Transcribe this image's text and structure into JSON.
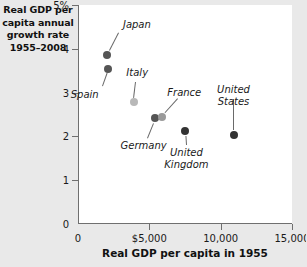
{
  "chart_data": {
    "type": "scatter",
    "title_lines": [
      "Real GDP per",
      "capita annual",
      "growth rate",
      "1955–2008"
    ],
    "xlabel": "Real GDP per capita in 1955",
    "ylabel": "Real GDP per capita annual growth rate 1955–2008",
    "xlim": [
      0,
      15000
    ],
    "ylim": [
      0,
      5
    ],
    "xticks": [
      0,
      5000,
      10000,
      15000
    ],
    "xtick_labels": [
      "0",
      "$5,000",
      "10,000",
      "15,000"
    ],
    "yticks": [
      0,
      1,
      2,
      3,
      4,
      5
    ],
    "ytick_labels": [
      "0",
      "1",
      "2",
      "3",
      "4",
      "5%"
    ],
    "grid": false,
    "legend": null,
    "points": [
      {
        "name": "Japan",
        "x": 2050,
        "y": 3.85,
        "color": "#555555",
        "label_x": 3150,
        "label_y": 4.55,
        "label_align": "left"
      },
      {
        "name": "Spain",
        "x": 2100,
        "y": 3.55,
        "color": "#555555",
        "label_x": 1450,
        "label_y": 2.95,
        "label_align": "right"
      },
      {
        "name": "Italy",
        "x": 3900,
        "y": 2.78,
        "color": "#b8b8b8",
        "label_x": 4150,
        "label_y": 3.45,
        "label_align": "center"
      },
      {
        "name": "Germany",
        "x": 5400,
        "y": 2.42,
        "color": "#555555",
        "label_x": 4600,
        "label_y": 1.78,
        "label_align": "center"
      },
      {
        "name": "France",
        "x": 5900,
        "y": 2.44,
        "color": "#9a9a9a",
        "label_x": 7450,
        "label_y": 3.0,
        "label_align": "center"
      },
      {
        "name": "United Kingdom",
        "x": 7500,
        "y": 2.12,
        "color": "#333333",
        "label_x": 7600,
        "label_y": 1.62,
        "label_align": "center"
      },
      {
        "name": "United States",
        "x": 10900,
        "y": 2.03,
        "color": "#333333",
        "label_x": 10900,
        "label_y": 3.05,
        "label_align": "center"
      }
    ]
  },
  "colors": {
    "background": "#e9e9e9",
    "plot_background": "#ffffff",
    "axis": "#6f6f6f",
    "text": "#1a1a1a"
  }
}
